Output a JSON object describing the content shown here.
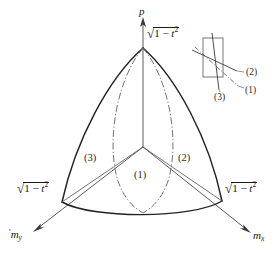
{
  "figure": {
    "background_color": "#ffffff",
    "line_color": "#222222",
    "thin_line_color": "#5a5a5a",
    "dashdot_color": "#6b6b6b"
  },
  "axes": [
    {
      "name": "p-axis",
      "label": "p",
      "direction": "up",
      "label_x": 139,
      "label_y": 6
    },
    {
      "name": "my-axis",
      "label_prefix": "'",
      "label_base": "m",
      "label_subscript": "y",
      "direction": "lower-left",
      "label_x": 9,
      "label_y": 231
    },
    {
      "name": "mx-axis",
      "label_base": "m",
      "label_subscript": "x",
      "direction": "lower-right",
      "label_x": 253,
      "label_y": 233
    }
  ],
  "vertex_labels": [
    {
      "name": "apex-radical",
      "text": "sqrt(1 - t^2)",
      "radicand_lead": "1 − ",
      "radicand_var": "t",
      "radicand_exp": "2",
      "x": 147,
      "y": 33
    },
    {
      "name": "left-vertex-radical",
      "text": "sqrt(1 - t^2)",
      "radicand_lead": "1 − ",
      "radicand_var": "t",
      "radicand_exp": "2",
      "x": 17,
      "y": 188
    },
    {
      "name": "right-vertex-radical",
      "text": "sqrt(1 - t^2)",
      "radicand_lead": "1 − ",
      "radicand_var": "t",
      "radicand_exp": "2",
      "x": 225,
      "y": 188
    }
  ],
  "region_labels": [
    {
      "name": "region-3",
      "text": "(3)",
      "x": 84,
      "y": 153
    },
    {
      "name": "region-2",
      "text": "(2)",
      "x": 178,
      "y": 153
    },
    {
      "name": "region-1",
      "text": "(1)",
      "x": 134,
      "y": 170
    }
  ],
  "inset": {
    "name": "detail-inset",
    "rect": {
      "x": 203,
      "y": 38,
      "width": 20,
      "height": 39
    },
    "labels": [
      {
        "name": "inset-label-2",
        "text": "(2)",
        "x": 246,
        "y": 74
      },
      {
        "name": "inset-label-1",
        "text": "(1)",
        "x": 245,
        "y": 93
      },
      {
        "name": "inset-label-3",
        "text": "(3)",
        "x": 216,
        "y": 97
      }
    ]
  },
  "geometry": {
    "apex": {
      "x": 143,
      "y": 48
    },
    "left_vertex": {
      "x": 62,
      "y": 202
    },
    "right_vertex": {
      "x": 222,
      "y": 201
    },
    "center_node": {
      "x": 143,
      "y": 147
    },
    "bottom_node": {
      "x": 143,
      "y": 213
    }
  }
}
